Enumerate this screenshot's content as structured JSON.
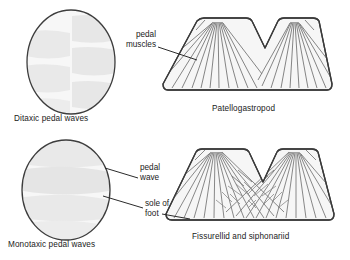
{
  "figure": {
    "colors": {
      "outline": "#4a4a4a",
      "oval_outline": "#3d3d3d",
      "fill": "#f7f7f7",
      "wave_patch": "#e6e6e6",
      "muscle_fiber": "#6b6b6b",
      "leader_line": "#2b2b2b",
      "text": "#1a1a1a",
      "background": "#ffffff"
    }
  },
  "panels": {
    "ditaxic_oval": {
      "caption": "Ditaxic pedal waves",
      "description": "Oval sole with staggered alternating left and right wave patches",
      "wave_pattern": "staggered",
      "patch_count": 6
    },
    "monotaxic_oval": {
      "caption": "Monotaxic pedal waves",
      "description": "Oval sole with full-width horizontal wave bands",
      "wave_pattern": "transverse bands",
      "band_count": 4
    },
    "patellogastropod": {
      "caption": "Patellogastropod",
      "description": "Transverse section of foot with two lateral fans of pedal muscles and a central V-shaped notch",
      "fan_count": 2,
      "fiber_count": 26,
      "central_notch": "V-shaped"
    },
    "fissurellid": {
      "caption": "Fissurellid and siphonariid",
      "description": "Transverse section of foot with fans of pedal muscles that cross in the midline forming a lattice",
      "fan_count": 2,
      "fiber_count": 30,
      "central_notch": "V-shaped with crossing fibers"
    }
  },
  "annotations": {
    "pedal_muscles": {
      "line1": "pedal",
      "line2": "muscles"
    },
    "pedal_wave": {
      "line1": "pedal",
      "line2": "wave"
    },
    "sole_of_foot": {
      "line1": "sole of",
      "line2": "foot"
    }
  }
}
